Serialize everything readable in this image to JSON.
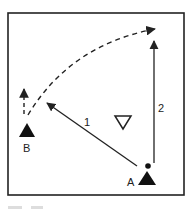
{
  "diagram": {
    "type": "play-diagram",
    "frame": {
      "x": 8,
      "y": 13,
      "width": 176,
      "height": 182,
      "stroke": "#222222"
    },
    "players": [
      {
        "id": "A",
        "label": "A",
        "shape": "filled-triangle",
        "x": 147,
        "y": 179,
        "has_ball": true
      },
      {
        "id": "B",
        "label": "B",
        "shape": "filled-triangle",
        "x": 27,
        "y": 130,
        "has_ball": false
      }
    ],
    "defender": {
      "shape": "outlined-inverted-triangle",
      "x": 123,
      "y": 122
    },
    "ball": {
      "x": 148,
      "y": 166
    },
    "arrows": [
      {
        "id": "1",
        "label": "1",
        "style": "solid",
        "from": [
          137,
          166
        ],
        "to": [
          46,
          102
        ],
        "meaning": "pass A to B"
      },
      {
        "id": "2",
        "label": "2",
        "style": "solid",
        "from": [
          154,
          163
        ],
        "to": [
          154,
          40
        ],
        "meaning": "A runs forward"
      },
      {
        "id": "B-run-short",
        "label": "",
        "style": "dashed",
        "from": [
          24,
          114
        ],
        "to": [
          24,
          88
        ]
      },
      {
        "id": "B-pass-curve",
        "label": "",
        "style": "dashed-curve",
        "from": [
          28,
          115
        ],
        "to": [
          157,
          29
        ],
        "meaning": "B passes into space"
      }
    ],
    "labels": {
      "arrow1": "1",
      "arrow2": "2",
      "playerA": "A",
      "playerB": "B"
    },
    "colors": {
      "ink": "#222222",
      "background": "#ffffff"
    }
  }
}
